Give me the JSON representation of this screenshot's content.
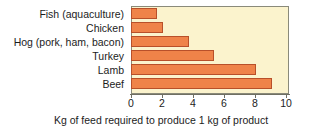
{
  "chart_data": {
    "type": "bar",
    "orientation": "horizontal",
    "title": "",
    "subtitle": "",
    "xlabel": "Kg of feed required to produce 1 kg of product",
    "ylabel": "",
    "categories": [
      "Fish (aquaculture)",
      "Chicken",
      "Hog (pork, ham, bacon)",
      "Turkey",
      "Lamb",
      "Beef"
    ],
    "values": [
      1.6,
      2.0,
      3.7,
      5.3,
      8.0,
      9.0
    ],
    "xlim": [
      0,
      10
    ],
    "ylim": null,
    "xticks": [
      "0",
      "2",
      "4",
      "6",
      "8",
      "10"
    ],
    "xtick_values": [
      0,
      2,
      4,
      6,
      8,
      10
    ],
    "grid": false,
    "legend": null,
    "legend_position": "none",
    "annotations": [],
    "colors": {
      "bar_fill": "#ef8349",
      "bar_edge": "#b8502a",
      "plot_background": "#fbf3cd",
      "plot_border": "#8a8a7a",
      "axis": "#6f6f62",
      "text": "#1c1c1c",
      "page_background": "#ffffff"
    }
  }
}
